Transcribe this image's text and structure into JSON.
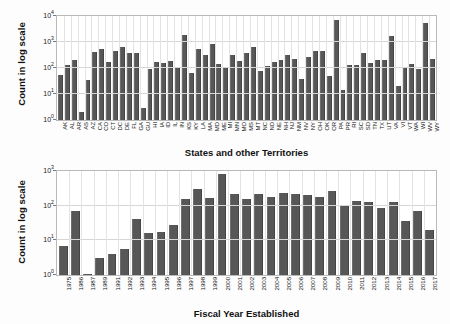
{
  "figure": {
    "ylabel_top": "Count in log scale",
    "ylabel_bottom": "Count in log scale",
    "xlabel_top": "States and other Territories",
    "xlabel_bottom": "Fiscal Year Established",
    "bar_color": "#575757",
    "grid_color": "#d6d6d6",
    "axis_color": "#b9b9b9",
    "background": "#ffffff"
  },
  "chart_data": [
    {
      "type": "bar",
      "title": "",
      "xlabel": "States and other Territories",
      "ylabel": "Count in log scale",
      "yscale": "log",
      "ylim": [
        1,
        10000
      ],
      "yticks": [
        1,
        10,
        100,
        1000,
        10000
      ],
      "ytick_labels": [
        "10^0",
        "10^1",
        "10^2",
        "10^3",
        "10^4"
      ],
      "grid": true,
      "legend": "none",
      "categories": [
        "AK",
        "AL",
        "AR",
        "AS",
        "AZ",
        "CA",
        "CO",
        "CT",
        "DC",
        "DE",
        "FL",
        "GA",
        "GU",
        "HI",
        "IA",
        "ID",
        "IL",
        "IN",
        "KS",
        "KY",
        "LA",
        "MA",
        "MD",
        "ME",
        "MI",
        "MN",
        "MO",
        "MS",
        "MT",
        "NC",
        "ND",
        "NE",
        "NH",
        "NJ",
        "NM",
        "NV",
        "NY",
        "OH",
        "OK",
        "OR",
        "PA",
        "PR",
        "RI",
        "SC",
        "SD",
        "TN",
        "TX",
        "UT",
        "VA",
        "VI",
        "VT",
        "WA",
        "WI",
        "WV",
        "WY"
      ],
      "values": [
        52,
        128,
        200,
        2,
        35,
        420,
        520,
        175,
        450,
        640,
        390,
        390,
        3,
        92,
        165,
        155,
        180,
        100,
        1800,
        65,
        560,
        330,
        840,
        140,
        112,
        310,
        180,
        380,
        640,
        80,
        120,
        165,
        210,
        320,
        215,
        38,
        265,
        470,
        440,
        48,
        7000,
        14,
        125,
        125,
        395,
        150,
        205,
        200,
        1750,
        20,
        105,
        140,
        92,
        5500,
        215
      ]
    },
    {
      "type": "bar",
      "title": "",
      "xlabel": "Fiscal Year Established",
      "ylabel": "Count in log scale",
      "yscale": "log",
      "ylim": [
        1,
        1000
      ],
      "yticks": [
        1,
        10,
        100,
        1000
      ],
      "ytick_labels": [
        "10^0",
        "10^1",
        "10^2",
        "10^3"
      ],
      "grid": true,
      "legend": "none",
      "categories": [
        "1975",
        "1986",
        "1987",
        "1989",
        "1991",
        "1992",
        "1993",
        "1994",
        "1995",
        "1996",
        "1997",
        "1998",
        "1999",
        "2000",
        "2001",
        "2002",
        "2003",
        "2004",
        "2005",
        "2006",
        "2007",
        "2008",
        "2009",
        "2010",
        "2011",
        "2012",
        "2013",
        "2014",
        "2015",
        "2016",
        "2017"
      ],
      "values": [
        7,
        68,
        1,
        3,
        4,
        5.5,
        41,
        16,
        17,
        28,
        160,
        310,
        165,
        820,
        215,
        155,
        215,
        180,
        240,
        215,
        200,
        180,
        270,
        105,
        135,
        128,
        85,
        128,
        36,
        72,
        20
      ]
    }
  ]
}
